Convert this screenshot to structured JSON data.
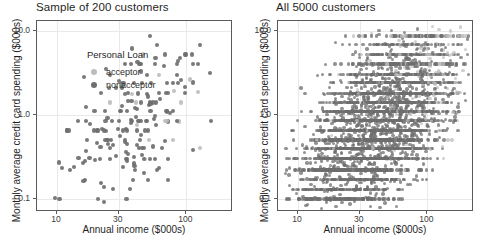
{
  "chart_data": {
    "type": "scatter",
    "xlabel": "Annual income ($000s)",
    "ylabel": "Monthly average credit card spending ($000s)",
    "xscale": "log",
    "yscale": "log",
    "xlim": [
      7,
      230
    ],
    "ylim": [
      0.07,
      13
    ],
    "xticks": [
      10,
      30,
      100
    ],
    "xtick_labels": [
      "10",
      "30",
      "100"
    ],
    "yticks": [
      0.1,
      1.0,
      10.0
    ],
    "ytick_labels": [
      "0.1",
      "1.0",
      "10.0"
    ],
    "grid": true,
    "legend": {
      "title": "Personal Loan",
      "position": "inside-top-left",
      "entries": [
        {
          "label": "acceptor",
          "color": "#bdbdbd",
          "key": "legend-dot-acceptor"
        },
        {
          "label": "nonacceptor",
          "color": "#6e6e6e",
          "key": "legend-dot-nonacceptor"
        }
      ]
    },
    "panels": [
      {
        "title": "Sample of 200 customers",
        "n_points": 200,
        "point_radius_px": 2.1,
        "seed": 20641,
        "density": "sparse",
        "acceptor_fraction": 0.1,
        "banding_strength": 0.55,
        "acceptor_bias_x": 1.9,
        "acceptor_bias_y": 2.0
      },
      {
        "title": "All 5000 customers",
        "n_points": 5000,
        "point_radius_px": 1.7,
        "seed": 90137,
        "density": "dense",
        "acceptor_fraction": 0.096,
        "banding_strength": 0.78,
        "acceptor_bias_x": 2.4,
        "acceptor_bias_y": 2.6
      }
    ]
  },
  "colors": {
    "acceptor": "#bdbdbd",
    "nonacceptor": "#6e6e6e",
    "panel_border": "#5a5a5a",
    "gridline": "#e9e9e9",
    "background": "#ffffff",
    "text": "#1f1f1f"
  }
}
